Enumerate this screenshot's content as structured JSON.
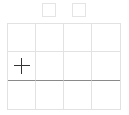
{
  "toolbar": {
    "boxes": [
      {
        "name": "option-box-1",
        "checked": false
      },
      {
        "name": "option-box-2",
        "checked": false
      }
    ]
  },
  "grid": {
    "rows": 3,
    "columns": 4,
    "highlight_row_divider_after": 2,
    "cursor_cell": {
      "row": 2,
      "column": 1
    },
    "cursor_icon": "crosshair-plus-icon"
  },
  "colors": {
    "grid_line": "#e2e2e2",
    "divider_line": "#8a8a8a",
    "icon": "#333333",
    "background": "#ffffff"
  }
}
